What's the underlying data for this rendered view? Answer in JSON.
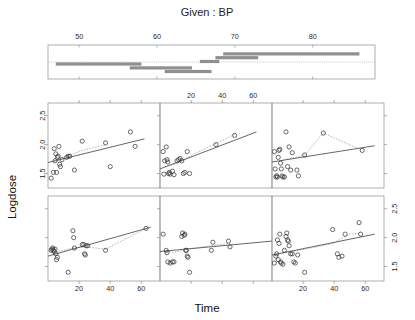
{
  "figure": {
    "type": "coplot",
    "given_title": "Given :  BP",
    "xlabel": "Time",
    "ylabel": "Logdose"
  },
  "given_panel": {
    "label": "Given :  BP",
    "axis_ticks": [
      50,
      60,
      70,
      80
    ],
    "axis_range": [
      46,
      88
    ],
    "intervals": [
      {
        "index": 1,
        "row": "lower",
        "from": 47.0,
        "to": 58.0
      },
      {
        "index": 2,
        "row": "lower",
        "from": 56.5,
        "to": 64.5
      },
      {
        "index": 3,
        "row": "lower",
        "from": 61.0,
        "to": 67.0
      },
      {
        "index": 4,
        "row": "upper",
        "from": 65.5,
        "to": 68.0
      },
      {
        "index": 5,
        "row": "upper",
        "from": 67.5,
        "to": 73.0
      },
      {
        "index": 6,
        "row": "upper",
        "from": 68.5,
        "to": 86.0
      }
    ]
  },
  "axes": {
    "x_ticks": [
      20,
      40,
      60
    ],
    "x_tick_labels": [
      "20",
      "40",
      "60"
    ],
    "x_range": [
      0,
      72
    ],
    "y_ticks": [
      1.5,
      2.0,
      2.5
    ],
    "y_tick_labels": [
      "1.5",
      "2.0",
      "2.5"
    ],
    "y_range": [
      1.25,
      2.72
    ]
  },
  "chart_data": {
    "type": "scatter",
    "title": "Given :  BP",
    "xlabel": "Time",
    "ylabel": "Logdose",
    "xlim": [
      0,
      72
    ],
    "ylim": [
      1.25,
      2.72
    ],
    "grid": false,
    "legend": "none",
    "conditioning_variable": "BP",
    "panel_layout": {
      "rows": 2,
      "cols": 3,
      "order": "bottom-left-to-top-right"
    },
    "panels": [
      {
        "id": "top-left",
        "panel_number": 4,
        "given_interval": [
          65.5,
          68.0
        ],
        "show_y_axis": "left",
        "show_x_axis": "none",
        "points": [
          {
            "x": 2.0,
            "y": 1.42
          },
          {
            "x": 3.5,
            "y": 1.52
          },
          {
            "x": 4.0,
            "y": 1.93
          },
          {
            "x": 4.5,
            "y": 1.72
          },
          {
            "x": 5.0,
            "y": 1.84
          },
          {
            "x": 5.5,
            "y": 1.52
          },
          {
            "x": 6.0,
            "y": 1.78
          },
          {
            "x": 6.5,
            "y": 1.8
          },
          {
            "x": 7.0,
            "y": 1.97
          },
          {
            "x": 7.5,
            "y": 1.66
          },
          {
            "x": 8.0,
            "y": 1.62
          },
          {
            "x": 9.0,
            "y": 1.74
          },
          {
            "x": 12.0,
            "y": 1.78
          },
          {
            "x": 13.0,
            "y": 1.8
          },
          {
            "x": 14.0,
            "y": 1.8
          },
          {
            "x": 17.0,
            "y": 1.56
          },
          {
            "x": 22.0,
            "y": 2.06
          },
          {
            "x": 37.0,
            "y": 2.03
          },
          {
            "x": 40.0,
            "y": 1.62
          },
          {
            "x": 53.0,
            "y": 2.22
          },
          {
            "x": 56.0,
            "y": 1.97
          }
        ],
        "fit_line": {
          "x0": 0,
          "y0": 1.69,
          "x1": 62,
          "y1": 2.1
        },
        "lowess": [
          {
            "x": 2,
            "y": 1.7
          },
          {
            "x": 8,
            "y": 1.76
          },
          {
            "x": 14,
            "y": 1.82
          },
          {
            "x": 22,
            "y": 1.9
          },
          {
            "x": 37,
            "y": 2.0
          }
        ]
      },
      {
        "id": "top-middle",
        "panel_number": 5,
        "given_interval": [
          67.5,
          73.0
        ],
        "show_y_axis": "none",
        "show_x_axis": "top",
        "points": [
          {
            "x": 2.0,
            "y": 1.88
          },
          {
            "x": 2.5,
            "y": 1.49
          },
          {
            "x": 3.0,
            "y": 1.72
          },
          {
            "x": 4.0,
            "y": 1.96
          },
          {
            "x": 4.5,
            "y": 1.74
          },
          {
            "x": 5.0,
            "y": 1.7
          },
          {
            "x": 5.5,
            "y": 1.5
          },
          {
            "x": 6.0,
            "y": 1.52
          },
          {
            "x": 6.5,
            "y": 1.49
          },
          {
            "x": 8.0,
            "y": 1.54
          },
          {
            "x": 9.0,
            "y": 1.48
          },
          {
            "x": 11.0,
            "y": 1.72
          },
          {
            "x": 12.0,
            "y": 1.74
          },
          {
            "x": 13.0,
            "y": 1.76
          },
          {
            "x": 14.0,
            "y": 1.72
          },
          {
            "x": 15.0,
            "y": 1.5
          },
          {
            "x": 16.0,
            "y": 1.52
          },
          {
            "x": 17.5,
            "y": 1.88
          },
          {
            "x": 19.0,
            "y": 1.5
          },
          {
            "x": 36.0,
            "y": 2.0
          },
          {
            "x": 48.0,
            "y": 2.16
          }
        ],
        "fit_line": {
          "x0": 0,
          "y0": 1.58,
          "x1": 62,
          "y1": 2.22
        },
        "lowess": [
          {
            "x": 3,
            "y": 1.62
          },
          {
            "x": 9,
            "y": 1.66
          },
          {
            "x": 14,
            "y": 1.72
          },
          {
            "x": 22,
            "y": 1.84
          },
          {
            "x": 36,
            "y": 2.02
          },
          {
            "x": 48,
            "y": 2.18
          }
        ]
      },
      {
        "id": "top-right",
        "panel_number": 6,
        "given_interval": [
          68.5,
          86.0
        ],
        "show_y_axis": "right-ticks",
        "show_x_axis": "none",
        "points": [
          {
            "x": 1.5,
            "y": 1.88
          },
          {
            "x": 2.0,
            "y": 1.58
          },
          {
            "x": 2.5,
            "y": 1.44
          },
          {
            "x": 3.0,
            "y": 1.46
          },
          {
            "x": 3.5,
            "y": 1.44
          },
          {
            "x": 4.0,
            "y": 1.78
          },
          {
            "x": 4.5,
            "y": 1.9
          },
          {
            "x": 5.0,
            "y": 1.92
          },
          {
            "x": 5.5,
            "y": 1.68
          },
          {
            "x": 6.0,
            "y": 1.58
          },
          {
            "x": 6.5,
            "y": 1.46
          },
          {
            "x": 7.0,
            "y": 1.44
          },
          {
            "x": 8.0,
            "y": 1.44
          },
          {
            "x": 9.0,
            "y": 2.22
          },
          {
            "x": 10.0,
            "y": 1.62
          },
          {
            "x": 11.0,
            "y": 1.96
          },
          {
            "x": 12.0,
            "y": 1.56
          },
          {
            "x": 13.0,
            "y": 1.86
          },
          {
            "x": 16.0,
            "y": 1.56
          },
          {
            "x": 17.0,
            "y": 1.46
          },
          {
            "x": 21.0,
            "y": 1.82
          },
          {
            "x": 33.0,
            "y": 2.2
          },
          {
            "x": 58.0,
            "y": 1.9
          }
        ],
        "fit_line": {
          "x0": 0,
          "y0": 1.7,
          "x1": 66,
          "y1": 1.98
        },
        "lowess": [
          {
            "x": 6,
            "y": 1.72
          },
          {
            "x": 11,
            "y": 1.76
          },
          {
            "x": 21,
            "y": 1.82
          },
          {
            "x": 33,
            "y": 2.2
          },
          {
            "x": 58,
            "y": 1.9
          }
        ]
      },
      {
        "id": "bottom-left",
        "panel_number": 1,
        "given_interval": [
          47.0,
          58.0
        ],
        "show_y_axis": "none",
        "show_x_axis": "bottom",
        "points": [
          {
            "x": 2.0,
            "y": 1.78
          },
          {
            "x": 2.5,
            "y": 1.8
          },
          {
            "x": 3.0,
            "y": 1.82
          },
          {
            "x": 3.5,
            "y": 1.78
          },
          {
            "x": 4.0,
            "y": 1.76
          },
          {
            "x": 4.5,
            "y": 1.8
          },
          {
            "x": 5.0,
            "y": 1.72
          },
          {
            "x": 5.5,
            "y": 1.62
          },
          {
            "x": 6.0,
            "y": 1.66
          },
          {
            "x": 13.0,
            "y": 1.4
          },
          {
            "x": 16.0,
            "y": 2.12
          },
          {
            "x": 16.5,
            "y": 2.0
          },
          {
            "x": 17.0,
            "y": 1.82
          },
          {
            "x": 22.0,
            "y": 1.88
          },
          {
            "x": 23.0,
            "y": 1.88
          },
          {
            "x": 23.5,
            "y": 1.72
          },
          {
            "x": 24.0,
            "y": 1.7
          },
          {
            "x": 24.5,
            "y": 1.86
          },
          {
            "x": 25.5,
            "y": 1.86
          },
          {
            "x": 37.0,
            "y": 1.78
          },
          {
            "x": 63.0,
            "y": 2.16
          }
        ],
        "fit_line": {
          "x0": 0,
          "y0": 1.68,
          "x1": 66,
          "y1": 2.18
        },
        "lowess": [
          {
            "x": 3,
            "y": 1.74
          },
          {
            "x": 16,
            "y": 1.82
          },
          {
            "x": 24,
            "y": 1.84
          },
          {
            "x": 37,
            "y": 1.8
          },
          {
            "x": 63,
            "y": 2.16
          }
        ]
      },
      {
        "id": "bottom-middle",
        "panel_number": 2,
        "given_interval": [
          56.5,
          64.5
        ],
        "show_y_axis": "none",
        "show_x_axis": "bottom-ticks",
        "points": [
          {
            "x": 2.0,
            "y": 2.06
          },
          {
            "x": 4.0,
            "y": 1.78
          },
          {
            "x": 4.5,
            "y": 1.74
          },
          {
            "x": 5.0,
            "y": 1.58
          },
          {
            "x": 6.5,
            "y": 1.56
          },
          {
            "x": 8.0,
            "y": 1.58
          },
          {
            "x": 9.0,
            "y": 1.58
          },
          {
            "x": 14.0,
            "y": 2.02
          },
          {
            "x": 14.5,
            "y": 2.08
          },
          {
            "x": 15.5,
            "y": 2.04
          },
          {
            "x": 16.0,
            "y": 2.06
          },
          {
            "x": 16.5,
            "y": 1.78
          },
          {
            "x": 17.0,
            "y": 1.78
          },
          {
            "x": 17.5,
            "y": 1.68
          },
          {
            "x": 18.0,
            "y": 1.66
          },
          {
            "x": 19.0,
            "y": 1.4
          },
          {
            "x": 33.0,
            "y": 1.78
          },
          {
            "x": 34.0,
            "y": 1.92
          },
          {
            "x": 44.0,
            "y": 1.94
          },
          {
            "x": 45.0,
            "y": 1.84
          }
        ],
        "fit_line": {
          "x0": 0,
          "y0": 1.76,
          "x1": 72,
          "y1": 1.94
        },
        "lowess": [
          {
            "x": 4,
            "y": 1.77
          },
          {
            "x": 9,
            "y": 1.74
          },
          {
            "x": 17,
            "y": 1.8
          },
          {
            "x": 33,
            "y": 1.86
          },
          {
            "x": 45,
            "y": 1.9
          }
        ]
      },
      {
        "id": "bottom-right",
        "panel_number": 3,
        "given_interval": [
          61.0,
          67.0
        ],
        "show_y_axis": "right",
        "show_x_axis": "bottom",
        "points": [
          {
            "x": 1.5,
            "y": 1.56
          },
          {
            "x": 2.5,
            "y": 1.68
          },
          {
            "x": 3.0,
            "y": 1.72
          },
          {
            "x": 3.5,
            "y": 1.96
          },
          {
            "x": 4.0,
            "y": 1.62
          },
          {
            "x": 4.5,
            "y": 1.9
          },
          {
            "x": 5.0,
            "y": 2.06
          },
          {
            "x": 5.5,
            "y": 1.58
          },
          {
            "x": 6.0,
            "y": 1.56
          },
          {
            "x": 7.0,
            "y": 1.54
          },
          {
            "x": 8.0,
            "y": 1.78
          },
          {
            "x": 9.0,
            "y": 2.02
          },
          {
            "x": 9.5,
            "y": 2.08
          },
          {
            "x": 10.0,
            "y": 1.96
          },
          {
            "x": 10.5,
            "y": 1.94
          },
          {
            "x": 11.0,
            "y": 1.86
          },
          {
            "x": 12.0,
            "y": 1.72
          },
          {
            "x": 13.0,
            "y": 1.72
          },
          {
            "x": 14.0,
            "y": 1.58
          },
          {
            "x": 15.0,
            "y": 1.56
          },
          {
            "x": 16.5,
            "y": 1.7
          },
          {
            "x": 21.0,
            "y": 1.4
          },
          {
            "x": 39.0,
            "y": 2.14
          },
          {
            "x": 42.0,
            "y": 1.72
          },
          {
            "x": 43.0,
            "y": 1.66
          },
          {
            "x": 45.0,
            "y": 1.68
          },
          {
            "x": 47.0,
            "y": 2.06
          },
          {
            "x": 56.0,
            "y": 2.26
          },
          {
            "x": 57.0,
            "y": 2.06
          }
        ],
        "fit_line": {
          "x0": 0,
          "y0": 1.7,
          "x1": 66,
          "y1": 2.06
        },
        "lowess": [
          {
            "x": 5,
            "y": 1.72
          },
          {
            "x": 13,
            "y": 1.76
          },
          {
            "x": 25,
            "y": 1.82
          },
          {
            "x": 39,
            "y": 1.9
          },
          {
            "x": 50,
            "y": 2.06
          },
          {
            "x": 57,
            "y": 2.08
          }
        ]
      }
    ]
  }
}
